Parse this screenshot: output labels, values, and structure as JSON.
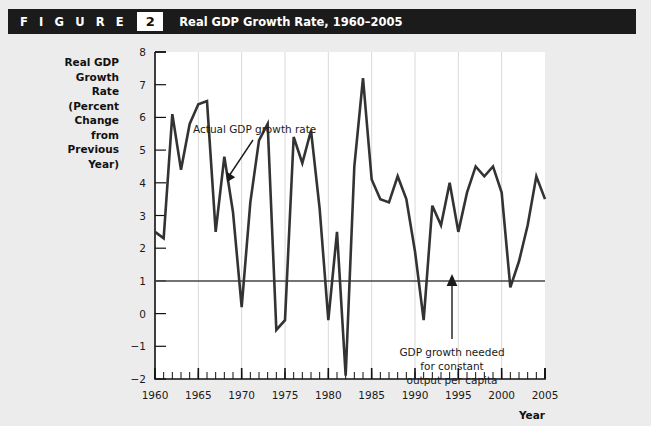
{
  "header": {
    "figure_word": "F I G U R E",
    "figure_number": "2",
    "title": "Real GDP Growth Rate, 1960–2005"
  },
  "colors": {
    "header_bar": "#1b1b1b",
    "header_text": "#ffffff",
    "page_background": "#ececec",
    "plot_background": "#ffffff",
    "series_line": "#333333",
    "reference_line": "#444444",
    "gridline": "#d8d8d8",
    "axis": "#111111"
  },
  "chart_data": {
    "type": "line",
    "title": "Real GDP Growth Rate, 1960–2005",
    "xlabel": "Year",
    "ylabel": "Real GDP Growth Rate (Percent Change from Previous Year)",
    "ylabel_lines": [
      "Real GDP",
      "Growth",
      "Rate",
      "(Percent",
      "Change",
      "from",
      "Previous",
      "Year)"
    ],
    "xlim": [
      1960,
      2005
    ],
    "ylim": [
      -2,
      8
    ],
    "y_ticks": [
      -2,
      -1,
      0,
      1,
      2,
      3,
      4,
      5,
      6,
      7,
      8
    ],
    "y_tick_labels": [
      "−2",
      "−1",
      "0",
      "1",
      "2",
      "3",
      "4",
      "5",
      "6",
      "7",
      "8"
    ],
    "x_ticks": [
      1960,
      1965,
      1970,
      1975,
      1980,
      1985,
      1990,
      1995,
      2000,
      2005
    ],
    "x_tick_labels": [
      "1960",
      "1965",
      "1970",
      "1975",
      "1980",
      "1985",
      "1990",
      "1995",
      "2000",
      "2005"
    ],
    "x_minor_tick_interval": 1,
    "grid": "vertical-major-only",
    "legend": "none",
    "x": [
      1960,
      1961,
      1962,
      1963,
      1964,
      1965,
      1966,
      1967,
      1968,
      1969,
      1970,
      1971,
      1972,
      1973,
      1974,
      1975,
      1976,
      1977,
      1978,
      1979,
      1980,
      1981,
      1982,
      1983,
      1984,
      1985,
      1986,
      1987,
      1988,
      1989,
      1990,
      1991,
      1992,
      1993,
      1994,
      1995,
      1996,
      1997,
      1998,
      1999,
      2000,
      2001,
      2002,
      2003,
      2004,
      2005
    ],
    "series": [
      {
        "name": "Actual GDP growth rate",
        "values": [
          2.5,
          2.3,
          6.1,
          4.4,
          5.8,
          6.4,
          6.5,
          2.5,
          4.8,
          3.1,
          0.2,
          3.4,
          5.3,
          5.8,
          -0.5,
          -0.2,
          5.4,
          4.6,
          5.6,
          3.2,
          -0.2,
          2.5,
          -1.9,
          4.5,
          7.2,
          4.1,
          3.5,
          3.4,
          4.2,
          3.5,
          1.9,
          -0.2,
          3.3,
          2.7,
          4.0,
          2.5,
          3.7,
          4.5,
          4.2,
          4.5,
          3.7,
          0.8,
          1.6,
          2.7,
          4.2,
          3.5
        ]
      }
    ],
    "reference_line": {
      "label": "GDP growth needed for constant output per capita",
      "value": 1.0
    },
    "annotations": [
      {
        "text": "Actual GDP growth rate",
        "lines": [
          "Actual GDP growth rate"
        ],
        "points_to_year": 1968,
        "points_to_value": 4.8
      },
      {
        "text": "GDP growth needed for constant output per capita",
        "lines": [
          "GDP growth needed",
          "for constant",
          "output per capita"
        ],
        "points_to_year": 1997,
        "points_to_value": 1.0
      }
    ]
  },
  "axis_labels": {
    "x_axis_name": "Year"
  }
}
